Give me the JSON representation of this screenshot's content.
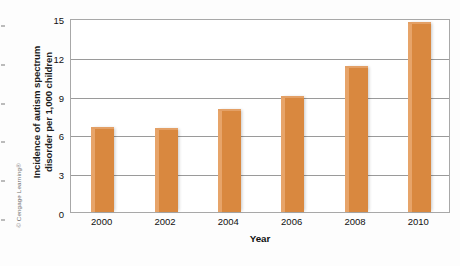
{
  "attribution": {
    "text": "© Cengage Learning®"
  },
  "chart_data": {
    "type": "bar",
    "title": "",
    "categories": [
      "2000",
      "2002",
      "2004",
      "2006",
      "2008",
      "2010"
    ],
    "values": [
      6.6,
      6.5,
      8.0,
      9.0,
      11.3,
      14.7
    ],
    "series": [
      {
        "name": "Incidence of autism spectrum disorder per 1,000 children",
        "values": [
          6.6,
          6.5,
          8.0,
          9.0,
          11.3,
          14.7
        ]
      }
    ],
    "xlabel": "Year",
    "ylabel": "Incidence of autism spectrum disorder per 1,000 children",
    "ylabel_line1": "Incidence of autism spectrum",
    "ylabel_line2": "disorder per 1,000 children",
    "ylim": [
      0,
      15
    ],
    "yticks": [
      "0",
      "3",
      "6",
      "9",
      "12",
      "15"
    ],
    "grid": true,
    "legend": "none",
    "bar_color": "#d9883f",
    "bar_highlight_color": "#e7a469",
    "gridline_color": "#9a9a9a",
    "frame_color": "#a8a8a8",
    "background_color": "#ffffff"
  }
}
